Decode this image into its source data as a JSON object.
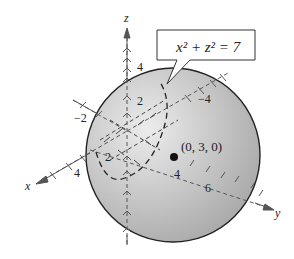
{
  "figure": {
    "callout": {
      "equation": "x² + z² = 7"
    },
    "point_label": "(0, 3, 0)",
    "axes": {
      "x": {
        "label": "x",
        "ticks": [
          "2",
          "4"
        ]
      },
      "y": {
        "label": "y",
        "ticks": [
          "−4",
          "4",
          "6"
        ]
      },
      "z": {
        "label": "z",
        "ticks": [
          "2",
          "4"
        ]
      },
      "neg_x_tick": "−2"
    },
    "colors": {
      "sphere_fill_light": "#e6e6e6",
      "sphere_fill_dark": "#a9a9a9",
      "outline": "#222222",
      "axis": "#555555"
    }
  }
}
